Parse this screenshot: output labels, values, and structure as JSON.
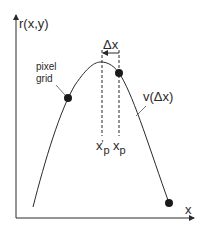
{
  "diagram": {
    "y_axis_label": "r(x,y)",
    "x_axis_label": "x",
    "annotation_pixel_grid_line1": "pixel",
    "annotation_pixel_grid_line2": "grid",
    "delta_label": "Δx",
    "xp_prime": {
      "base": "x",
      "prime": "'",
      "subscript": "p"
    },
    "xp": {
      "base": "x",
      "subscript": "p"
    },
    "curve_label": "v(Δx)",
    "colors": {
      "stroke": "#2a2a2a",
      "point": "#1a1a1a",
      "background": "#ffffff"
    },
    "points": [
      {
        "name": "pixel-grid-point",
        "x": 68,
        "y": 98
      },
      {
        "name": "xp-point",
        "x": 119,
        "y": 73
      },
      {
        "name": "end-point",
        "x": 169,
        "y": 203
      }
    ]
  }
}
